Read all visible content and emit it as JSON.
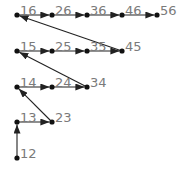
{
  "diagram": {
    "type": "directed-graph",
    "colors": {
      "edge": "#222222",
      "node": "#111111",
      "label": "#7a7a7a",
      "background": "#ffffff"
    },
    "nodes": [
      {
        "id": "12",
        "label": "12",
        "x": 17,
        "y": 158
      },
      {
        "id": "13",
        "label": "13",
        "x": 17,
        "y": 122
      },
      {
        "id": "23",
        "label": "23",
        "x": 52,
        "y": 122
      },
      {
        "id": "14",
        "label": "14",
        "x": 17,
        "y": 87
      },
      {
        "id": "24",
        "label": "24",
        "x": 52,
        "y": 87
      },
      {
        "id": "34",
        "label": "34",
        "x": 87,
        "y": 87
      },
      {
        "id": "15",
        "label": "15",
        "x": 17,
        "y": 51
      },
      {
        "id": "25",
        "label": "25",
        "x": 52,
        "y": 51
      },
      {
        "id": "35",
        "label": "35",
        "x": 87,
        "y": 51
      },
      {
        "id": "45",
        "label": "45",
        "x": 122,
        "y": 51
      },
      {
        "id": "16",
        "label": "16",
        "x": 17,
        "y": 15
      },
      {
        "id": "26",
        "label": "26",
        "x": 52,
        "y": 15
      },
      {
        "id": "36",
        "label": "36",
        "x": 87,
        "y": 15
      },
      {
        "id": "46",
        "label": "46",
        "x": 122,
        "y": 15
      },
      {
        "id": "56",
        "label": "56",
        "x": 157,
        "y": 15
      }
    ],
    "edges": [
      {
        "from": "12",
        "to": "13"
      },
      {
        "from": "13",
        "to": "23"
      },
      {
        "from": "23",
        "to": "14"
      },
      {
        "from": "14",
        "to": "24"
      },
      {
        "from": "24",
        "to": "34"
      },
      {
        "from": "34",
        "to": "15"
      },
      {
        "from": "15",
        "to": "25"
      },
      {
        "from": "25",
        "to": "35"
      },
      {
        "from": "35",
        "to": "45"
      },
      {
        "from": "45",
        "to": "16"
      },
      {
        "from": "16",
        "to": "26"
      },
      {
        "from": "26",
        "to": "36"
      },
      {
        "from": "36",
        "to": "46"
      },
      {
        "from": "46",
        "to": "56"
      }
    ]
  }
}
